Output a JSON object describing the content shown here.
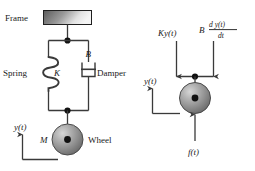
{
  "figure": {
    "type": "engineering-schematic",
    "colors": {
      "line": "#3a3a3a",
      "text": "#1a1a1a",
      "frame_gradient_dark": "#5a5a5a",
      "frame_gradient_light": "#f2f2f2",
      "wheel_highlight": "#c9c9c9",
      "wheel_mid": "#8e8e8e",
      "wheel_dark": "#6b6b6b",
      "hub": "#111111"
    }
  },
  "left_diagram": {
    "name": "physical-schematic",
    "frame_label": "Frame",
    "spring_label": "Spring",
    "spring_constant": "K",
    "damper_label": "Damper",
    "damper_constant": "B",
    "mass_label": "M",
    "wheel_label": "Wheel",
    "displacement_label": "y(t)"
  },
  "right_diagram": {
    "name": "free-body-diagram",
    "spring_force": "Ky(t)",
    "damper_force_coeff": "B",
    "damper_force_numerator": "d y(t)",
    "damper_force_denominator": "dt",
    "input_force": "f(t)",
    "displacement_label": "y(t)"
  }
}
